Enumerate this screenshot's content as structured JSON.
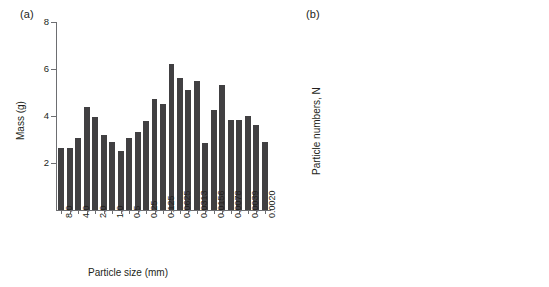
{
  "figure": {
    "background": "#ffffff",
    "bar_color": "#414042",
    "axis_color": "#6d6e71",
    "text_color": "#231f20"
  },
  "panel_a": {
    "label": "(a)",
    "chart_data": {
      "type": "bar",
      "title": "",
      "xlabel": "Particle size (mm)",
      "ylabel": "Mass (g)",
      "ylim": [
        0,
        8
      ],
      "ytick_labels": [
        "2",
        "4",
        "6",
        "8"
      ],
      "ytick_values": [
        2,
        4,
        6,
        8
      ],
      "grid": false,
      "legend": "none",
      "xtick_labels": [
        "8.0",
        "4.0",
        "2.0",
        "1.0",
        "0.5",
        "0.25",
        "0.125",
        "0.0625",
        "0.0313",
        "0.0156",
        "0.0078",
        "0.0039",
        "0.0020"
      ],
      "xtick_bar_index": [
        0,
        2,
        4,
        6,
        8,
        10,
        12,
        14,
        16,
        18,
        20,
        22,
        24
      ],
      "values": [
        2.65,
        2.62,
        3.05,
        4.4,
        3.97,
        3.18,
        2.88,
        2.52,
        3.05,
        3.3,
        3.78,
        4.72,
        4.5,
        6.23,
        5.6,
        5.12,
        5.5,
        2.86,
        4.25,
        5.3,
        3.82,
        3.85,
        4.02,
        3.62,
        2.88
      ]
    }
  },
  "panel_b": {
    "label": "(b)",
    "annotation": {
      "slope_symbol": "m",
      "slope_text": " = 3.032",
      "r2_symbol": "r",
      "r2_sup": "2",
      "r2_text": " = 0.999"
    },
    "chart_data": {
      "type": "scatter",
      "title": "",
      "xlabel": "Particle size, d (mm)",
      "ylabel": "Particle numbers, N",
      "xscale": "log",
      "yscale": "log",
      "xlim": [
        0.001,
        10
      ],
      "ylim": [
        1,
        10000000000000.0
      ],
      "grid": false,
      "legend": "none",
      "marker": "cross",
      "xtick_labels": [
        "0.001",
        "0.01",
        "0.1",
        "1",
        "10"
      ],
      "xtick_values": [
        0.001,
        0.01,
        0.1,
        1,
        10
      ],
      "ytick_labels": [
        "10",
        "10",
        "10",
        "10",
        "10",
        "10",
        "10"
      ],
      "ytick_exponents": [
        "13",
        "11",
        "9",
        "7",
        "5",
        "3",
        ""
      ],
      "ytick_values": [
        10000000000000.0,
        100000000000.0,
        1000000000.0,
        10000000.0,
        100000.0,
        1000.0,
        10
      ],
      "fit": {
        "slope": -3.032,
        "r_squared": 0.999,
        "intercept_log10_at_d1": 4.05
      },
      "points_x": [
        0.0011,
        0.0015,
        0.002,
        0.0028,
        0.0039,
        0.0055,
        0.0078,
        0.011,
        0.0156,
        0.0221,
        0.0313,
        0.0442,
        0.0625,
        0.0884,
        0.125,
        0.177,
        0.25,
        0.354,
        0.5,
        0.707,
        1.0,
        1.41,
        2.0,
        2.83,
        4.0,
        5.66,
        8.0
      ],
      "points_y": [
        2000000000000.0,
        750000000000.0,
        320000000000.0,
        110000000000.0,
        41000000000.0,
        14000000000.0,
        5000000000.0,
        1800000000.0,
        620000000.0,
        220000000.0,
        78000000.0,
        27000000.0,
        9500000.0,
        3400000.0,
        1200000.0,
        420000.0,
        150000.0,
        52000.0,
        19000.0,
        6600.0,
        2300.0,
        800.0,
        290.0,
        100.0,
        36.0,
        13.0,
        4.5
      ]
    }
  }
}
